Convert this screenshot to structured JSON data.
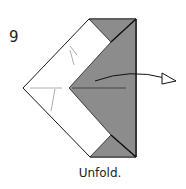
{
  "step": {
    "number": "9",
    "instruction": "Unfold."
  },
  "colors": {
    "paper_white": "#ffffff",
    "paper_colored": "#8c8c8c",
    "outline": "#1a1a1a",
    "crease": "#999999"
  },
  "diagram": {
    "shape": "origami model, folded square viewed as pentagon with colored right band",
    "arrow": "unfold arrow pointing right (hollow head)"
  }
}
